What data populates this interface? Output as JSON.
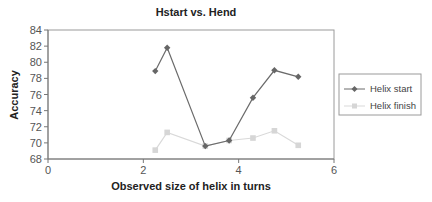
{
  "chart_data": {
    "type": "line",
    "title": "Hstart vs. Hend",
    "xlabel": "Observed size of helix in turns",
    "ylabel": "Accuracy",
    "xlim": [
      0,
      6
    ],
    "ylim": [
      68,
      84
    ],
    "x_ticks": [
      "0",
      "2",
      "4",
      "6"
    ],
    "y_ticks": [
      "68",
      "70",
      "72",
      "74",
      "76",
      "78",
      "80",
      "82",
      "84"
    ],
    "grid": false,
    "legend_position": "right",
    "series": [
      {
        "name": "Helix start",
        "color": "#6b6b6b",
        "marker": "diamond",
        "x": [
          2.25,
          2.5,
          3.3,
          3.8,
          4.3,
          4.75,
          5.25
        ],
        "values": [
          78.9,
          81.8,
          69.6,
          70.3,
          75.6,
          79.0,
          78.2
        ]
      },
      {
        "name": "Helix finish",
        "color": "#d9d9d9",
        "marker": "square",
        "x": [
          2.25,
          2.5,
          3.3,
          3.8,
          4.3,
          4.75,
          5.25
        ],
        "values": [
          69.1,
          71.3,
          69.6,
          70.3,
          70.6,
          71.5,
          69.7
        ]
      }
    ]
  },
  "legend": {
    "items": [
      "Helix start",
      "Helix finish"
    ]
  }
}
